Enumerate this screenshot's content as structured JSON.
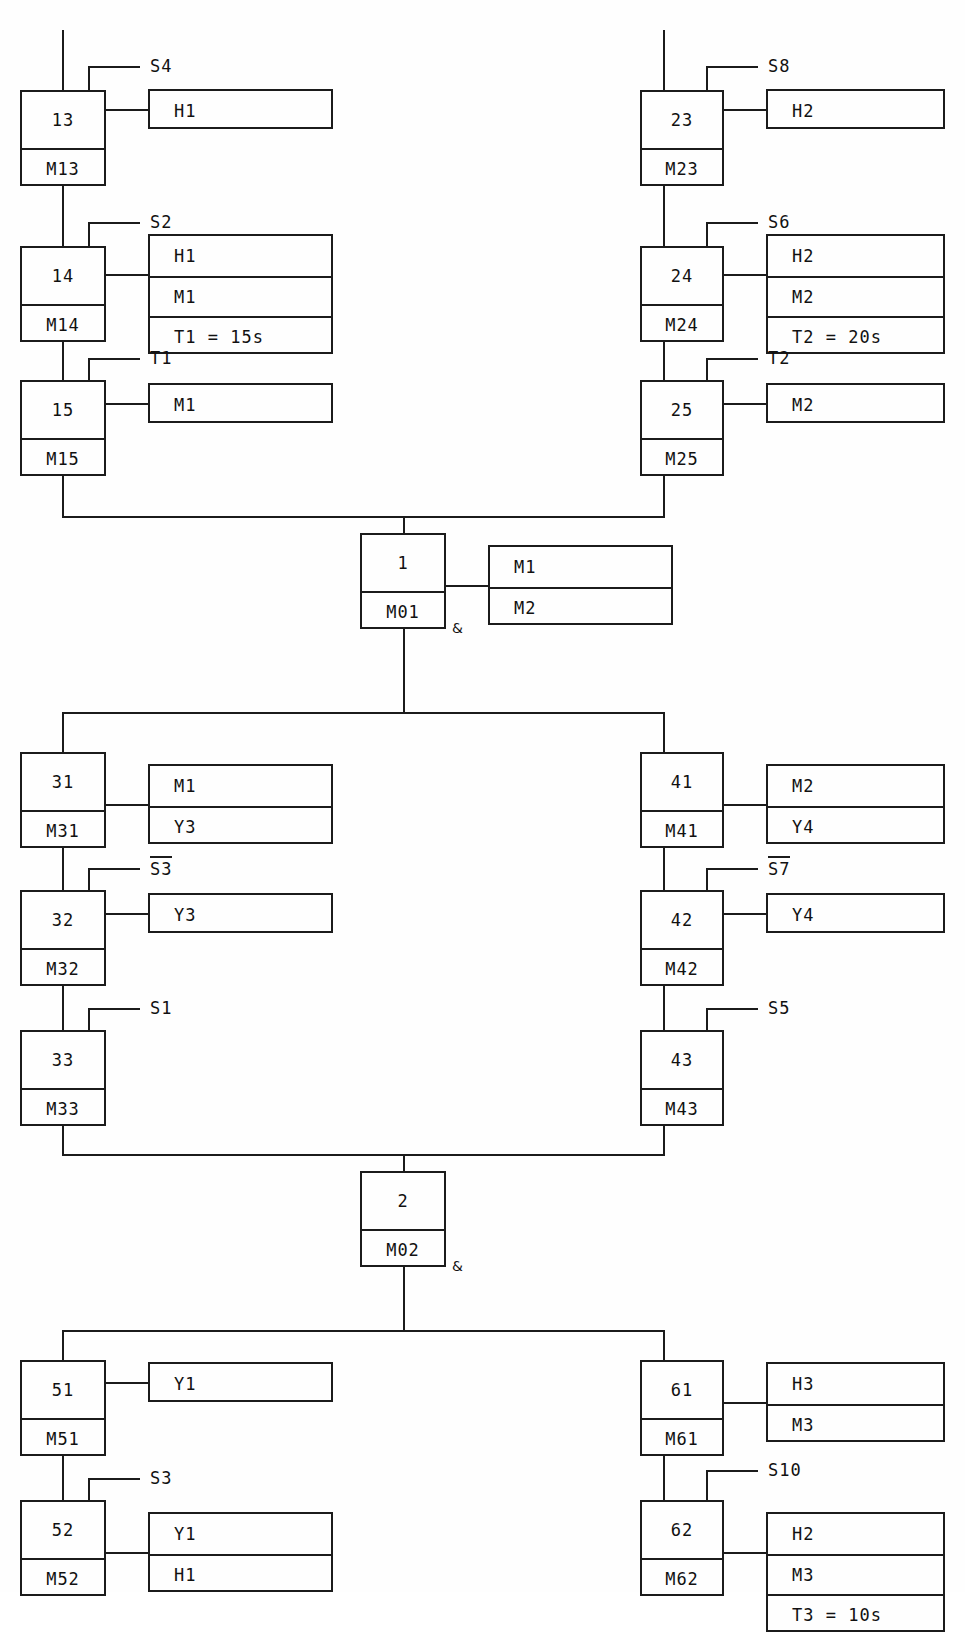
{
  "diagram": {
    "type": "sequential-function-chart",
    "title": "",
    "steps": [
      {
        "id": "13",
        "num": "13",
        "mem": "M13",
        "transition": "S4",
        "negated": false,
        "actions": [
          "H1"
        ]
      },
      {
        "id": "14",
        "num": "14",
        "mem": "M14",
        "transition": "S2",
        "negated": false,
        "actions": [
          "H1",
          "M1",
          "T1 = 15s"
        ]
      },
      {
        "id": "15",
        "num": "15",
        "mem": "M15",
        "transition": "T1",
        "negated": false,
        "actions": [
          "M1"
        ]
      },
      {
        "id": "23",
        "num": "23",
        "mem": "M23",
        "transition": "S8",
        "negated": false,
        "actions": [
          "H2"
        ]
      },
      {
        "id": "24",
        "num": "24",
        "mem": "M24",
        "transition": "S6",
        "negated": false,
        "actions": [
          "H2",
          "M2",
          "T2 = 20s"
        ]
      },
      {
        "id": "25",
        "num": "25",
        "mem": "M25",
        "transition": "T2",
        "negated": false,
        "actions": [
          "M2"
        ]
      },
      {
        "id": "1",
        "num": "1",
        "mem": "M01",
        "transition": "",
        "negated": false,
        "actions": [
          "M1",
          "M2"
        ]
      },
      {
        "id": "31",
        "num": "31",
        "mem": "M31",
        "transition": "",
        "negated": false,
        "actions": [
          "M1",
          "Y3"
        ]
      },
      {
        "id": "32",
        "num": "32",
        "mem": "M32",
        "transition": "S3",
        "negated": true,
        "actions": [
          "Y3"
        ]
      },
      {
        "id": "33",
        "num": "33",
        "mem": "M33",
        "transition": "S1",
        "negated": false,
        "actions": []
      },
      {
        "id": "41",
        "num": "41",
        "mem": "M41",
        "transition": "",
        "negated": false,
        "actions": [
          "M2",
          "Y4"
        ]
      },
      {
        "id": "42",
        "num": "42",
        "mem": "M42",
        "transition": "S7",
        "negated": true,
        "actions": [
          "Y4"
        ]
      },
      {
        "id": "43",
        "num": "43",
        "mem": "M43",
        "transition": "S5",
        "negated": false,
        "actions": []
      },
      {
        "id": "2",
        "num": "2",
        "mem": "M02",
        "transition": "",
        "negated": false,
        "actions": []
      },
      {
        "id": "51",
        "num": "51",
        "mem": "M51",
        "transition": "",
        "negated": false,
        "actions": [
          "Y1"
        ]
      },
      {
        "id": "52",
        "num": "52",
        "mem": "M52",
        "transition": "S3",
        "negated": false,
        "actions": [
          "Y1",
          "H1"
        ]
      },
      {
        "id": "61",
        "num": "61",
        "mem": "M61",
        "transition": "",
        "negated": false,
        "actions": [
          "H3",
          "M3"
        ]
      },
      {
        "id": "62",
        "num": "62",
        "mem": "M62",
        "transition": "S10",
        "negated": false,
        "actions": [
          "H2",
          "M3",
          "T3 = 10s"
        ]
      }
    ],
    "convergence_markers": [
      "&",
      "&"
    ]
  },
  "s13": {
    "num": "13",
    "mem": "M13",
    "trans": "S4",
    "a0": "H1"
  },
  "s14": {
    "num": "14",
    "mem": "M14",
    "trans": "S2",
    "a0": "H1",
    "a1": "M1",
    "a2": "T1 = 15s"
  },
  "s15": {
    "num": "15",
    "mem": "M15",
    "trans": "T1",
    "a0": "M1"
  },
  "s23": {
    "num": "23",
    "mem": "M23",
    "trans": "S8",
    "a0": "H2"
  },
  "s24": {
    "num": "24",
    "mem": "M24",
    "trans": "S6",
    "a0": "H2",
    "a1": "M2",
    "a2": "T2 = 20s"
  },
  "s25": {
    "num": "25",
    "mem": "M25",
    "trans": "T2",
    "a0": "M2"
  },
  "s1": {
    "num": "1",
    "mem": "M01",
    "a0": "M1",
    "a1": "M2",
    "amp": "&"
  },
  "s31": {
    "num": "31",
    "mem": "M31",
    "a0": "M1",
    "a1": "Y3"
  },
  "s32": {
    "num": "32",
    "mem": "M32",
    "trans": "S3",
    "a0": "Y3"
  },
  "s33": {
    "num": "33",
    "mem": "M33",
    "trans": "S1"
  },
  "s41": {
    "num": "41",
    "mem": "M41",
    "a0": "M2",
    "a1": "Y4"
  },
  "s42": {
    "num": "42",
    "mem": "M42",
    "trans": "S7",
    "a0": "Y4"
  },
  "s43": {
    "num": "43",
    "mem": "M43",
    "trans": "S5"
  },
  "s2": {
    "num": "2",
    "mem": "M02",
    "amp": "&"
  },
  "s51": {
    "num": "51",
    "mem": "M51",
    "a0": "Y1"
  },
  "s52": {
    "num": "52",
    "mem": "M52",
    "trans": "S3",
    "a0": "Y1",
    "a1": "H1"
  },
  "s61": {
    "num": "61",
    "mem": "M61",
    "a0": "H3",
    "a1": "M3"
  },
  "s62": {
    "num": "62",
    "mem": "M62",
    "trans": "S10",
    "a0": "H2",
    "a1": "M3",
    "a2": "T3 = 10s"
  },
  "colors": {
    "ink": "#1b1b1b",
    "paper": "#fefefe"
  }
}
